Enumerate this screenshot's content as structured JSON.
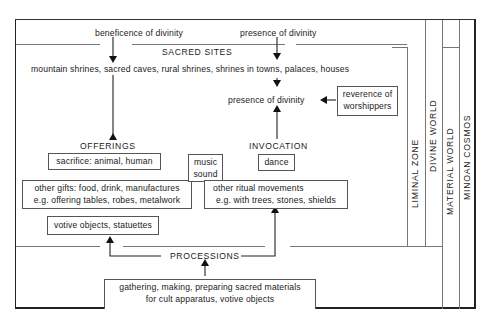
{
  "diagram": {
    "top_labels": {
      "beneficence": "beneficence of divinity",
      "presence_top": "presence of divinity"
    },
    "sacred_sites": {
      "title": "SACRED SITES",
      "list": "mountain shrines, sacred caves, rural shrines, shrines in towns, palaces, houses"
    },
    "presence_middle": "presence of divinity",
    "reverence_box": {
      "line1": "reverence of",
      "line2": "worshippers"
    },
    "offerings": {
      "title": "OFFERINGS",
      "sacrifice": "sacrifice: animal, human",
      "gifts_line1": "other gifts: food, drink, manufactures",
      "gifts_line2": "e.g. offering  tables, robes, metalwork",
      "votive": "votive objects, statuettes"
    },
    "music_box": {
      "line1": "music",
      "line2": "sound"
    },
    "invocation": {
      "title": "INVOCATION",
      "dance": "dance",
      "ritual_line1": "other ritual movements",
      "ritual_line2": "e.g. with trees, stones, shields"
    },
    "processions": "PROCESSIONS",
    "gathering_box": {
      "line1": "gathering, making, preparing sacred materials",
      "line2": "for cult apparatus, votive objects"
    },
    "zones": {
      "liminal": "LIMINAL  ZONE",
      "divine": "DIVINE  WORLD",
      "material": "MATERIAL  WORLD",
      "minoan": "MINOAN  COSMOS"
    },
    "colors": {
      "line": "#777777",
      "frame": "#222222",
      "text": "#1a1a1a"
    }
  }
}
